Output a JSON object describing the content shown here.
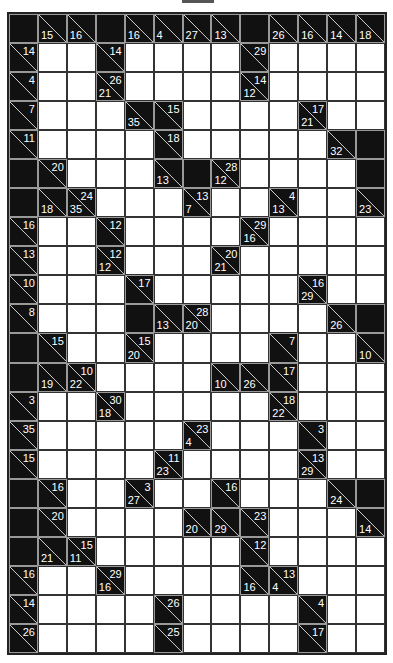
{
  "puzzle": {
    "type": "kakuro",
    "rows": 22,
    "cols": 13,
    "legend": {
      "b": "black cell",
      "w": "empty white cell",
      "clue": "d = down sum (bottom-left), r = across sum (top-right)"
    },
    "grid": [
      [
        "b",
        {
          "d": 15
        },
        {
          "d": 16
        },
        "b",
        {
          "d": 16
        },
        {
          "d": 4
        },
        {
          "d": 27
        },
        {
          "d": 13
        },
        "b",
        {
          "d": 26
        },
        {
          "d": 16
        },
        {
          "d": 14
        },
        {
          "d": 18
        }
      ],
      [
        {
          "r": 14
        },
        "w",
        "w",
        {
          "r": 14
        },
        "w",
        "w",
        "w",
        "w",
        {
          "r": 29
        },
        "w",
        "w",
        "w",
        "w"
      ],
      [
        {
          "r": 4
        },
        "w",
        "w",
        {
          "d": 21,
          "r": 26
        },
        "w",
        "w",
        "w",
        "w",
        {
          "d": 12,
          "r": 14
        },
        "w",
        "w",
        "w",
        "w"
      ],
      [
        {
          "r": 7
        },
        "w",
        "w",
        "w",
        {
          "d": 35
        },
        {
          "r": 15
        },
        "w",
        "w",
        "w",
        "w",
        {
          "d": 21,
          "r": 17
        },
        "w",
        "w"
      ],
      [
        {
          "r": 11
        },
        "w",
        "w",
        "w",
        "w",
        {
          "r": 18
        },
        "w",
        "w",
        "w",
        "w",
        "w",
        {
          "d": 32
        },
        "b"
      ],
      [
        "b",
        {
          "r": 20
        },
        "w",
        "w",
        "w",
        {
          "d": 13
        },
        "b",
        {
          "d": 12,
          "r": 28
        },
        "w",
        "w",
        "w",
        "w",
        "b"
      ],
      [
        "b",
        {
          "d": 18
        },
        {
          "d": 35,
          "r": 24
        },
        "w",
        "w",
        "w",
        {
          "d": 7,
          "r": 13
        },
        "w",
        "w",
        {
          "d": 13,
          "r": 4
        },
        "w",
        "w",
        {
          "d": 23
        }
      ],
      [
        {
          "r": 16
        },
        "w",
        "w",
        {
          "r": 12
        },
        "w",
        "w",
        "w",
        "w",
        {
          "d": 16,
          "r": 29
        },
        "w",
        "w",
        "w",
        "w"
      ],
      [
        {
          "r": 13
        },
        "w",
        "w",
        {
          "d": 12,
          "r": 12
        },
        "w",
        "w",
        "w",
        {
          "d": 21,
          "r": 20
        },
        "w",
        "w",
        "w",
        "w",
        "w"
      ],
      [
        {
          "r": 10
        },
        "w",
        "w",
        "w",
        {
          "r": 17
        },
        "w",
        "w",
        "w",
        "w",
        "w",
        {
          "d": 29,
          "r": 16
        },
        "w",
        "w"
      ],
      [
        {
          "r": 8
        },
        "w",
        "w",
        "w",
        "b",
        {
          "d": 13
        },
        {
          "d": 20,
          "r": 28
        },
        "w",
        "w",
        "w",
        "w",
        {
          "d": 26
        },
        "b"
      ],
      [
        "b",
        {
          "r": 15
        },
        "w",
        "w",
        {
          "d": 20,
          "r": 15
        },
        "w",
        "w",
        "w",
        "w",
        {
          "r": 7
        },
        "w",
        "w",
        {
          "d": 10
        }
      ],
      [
        "b",
        {
          "d": 19
        },
        {
          "d": 22,
          "r": 10
        },
        "w",
        "w",
        "w",
        "w",
        {
          "d": 10
        },
        {
          "d": 26
        },
        {
          "r": 17
        },
        "w",
        "w",
        "w"
      ],
      [
        {
          "r": 3
        },
        "w",
        "w",
        {
          "d": 18,
          "r": 30
        },
        "w",
        "w",
        "w",
        "w",
        "w",
        {
          "d": 22,
          "r": 18
        },
        "w",
        "w",
        "w"
      ],
      [
        {
          "r": 35
        },
        "w",
        "w",
        "w",
        "w",
        "w",
        {
          "d": 4,
          "r": 23
        },
        "w",
        "w",
        "w",
        {
          "r": 3
        },
        "w",
        "w"
      ],
      [
        {
          "r": 15
        },
        "w",
        "w",
        "w",
        "w",
        {
          "d": 23,
          "r": 11
        },
        "w",
        "w",
        "w",
        "w",
        {
          "d": 29,
          "r": 13
        },
        "w",
        "w"
      ],
      [
        "b",
        {
          "r": 16
        },
        "w",
        "w",
        {
          "d": 27,
          "r": 3
        },
        "w",
        "w",
        {
          "r": 16
        },
        "w",
        "w",
        "w",
        {
          "d": 24
        },
        "b"
      ],
      [
        "b",
        {
          "r": 20
        },
        "w",
        "w",
        "w",
        "w",
        {
          "d": 20
        },
        {
          "d": 29
        },
        {
          "r": 23
        },
        "w",
        "w",
        "w",
        {
          "d": 14
        }
      ],
      [
        "b",
        {
          "d": 21
        },
        {
          "d": 11,
          "r": 15
        },
        "w",
        "w",
        "w",
        "w",
        "w",
        {
          "r": 12
        },
        "w",
        "w",
        "w",
        "w"
      ],
      [
        {
          "r": 16
        },
        "w",
        "w",
        {
          "d": 16,
          "r": 29
        },
        "w",
        "w",
        "w",
        "w",
        {
          "d": 16
        },
        {
          "d": 4,
          "r": 13
        },
        "w",
        "w",
        "w"
      ],
      [
        {
          "r": 14
        },
        "w",
        "w",
        "w",
        "w",
        {
          "r": 26
        },
        "w",
        "w",
        "w",
        "w",
        {
          "r": 4
        },
        "w",
        "w"
      ],
      [
        {
          "r": 26
        },
        "w",
        "w",
        "w",
        "w",
        {
          "r": 25
        },
        "w",
        "w",
        "w",
        "w",
        {
          "r": 17
        },
        "w",
        "w"
      ]
    ]
  },
  "colors": {
    "black": "#111111",
    "white": "#ffffff",
    "grid_line": "#333333",
    "clue_text": "#ffffff"
  }
}
